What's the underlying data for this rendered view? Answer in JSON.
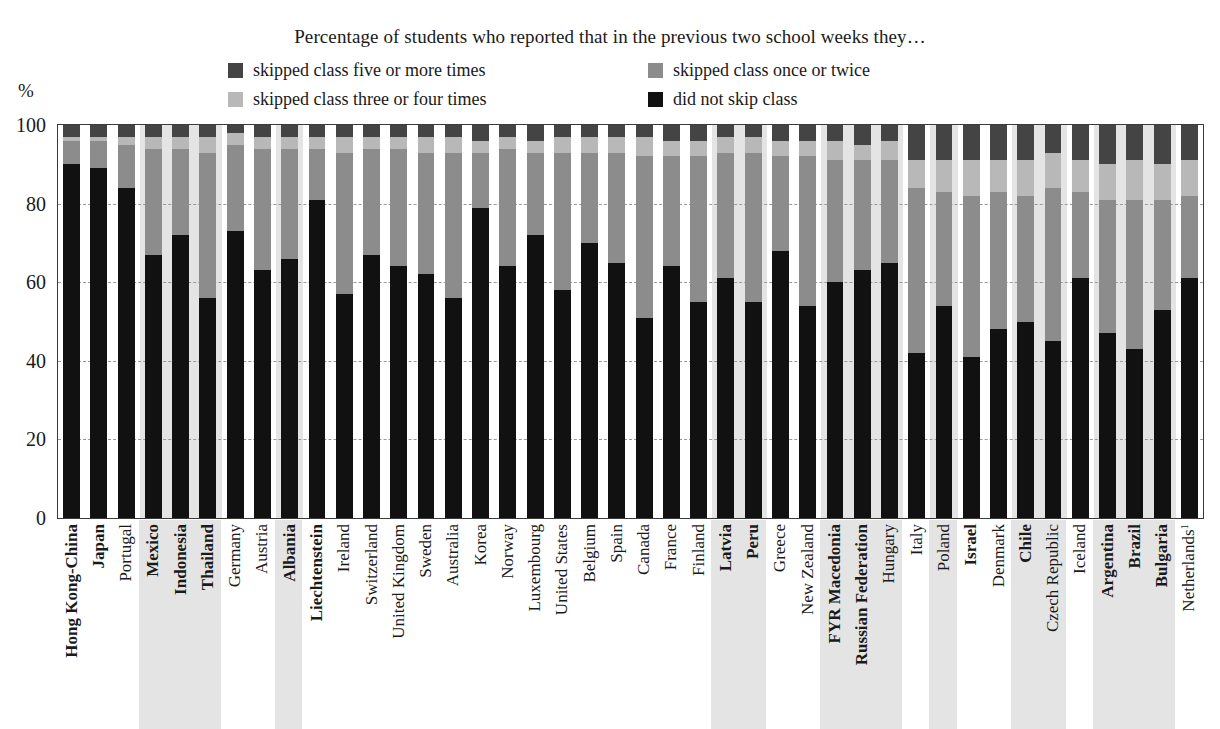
{
  "header": {
    "title": "Percentage of students who reported that in the previous two school weeks they…",
    "axis_unit": "%"
  },
  "legend": [
    {
      "label": "skipped class five or more times",
      "color": "#444444",
      "key": "five_or_more"
    },
    {
      "label": "skipped class once or twice",
      "color": "#8c8c8c",
      "key": "once_or_twice"
    },
    {
      "label": "skipped class three or four times",
      "color": "#b8b8b8",
      "key": "three_or_four"
    },
    {
      "label": "did not skip class",
      "color": "#111111",
      "key": "did_not_skip"
    }
  ],
  "chart_data": {
    "type": "bar",
    "stacked": true,
    "title": "Percentage of students who reported that in the previous two school weeks they…",
    "xlabel": "",
    "ylabel": "%",
    "ylim": [
      0,
      100
    ],
    "yticks": [
      0,
      20,
      40,
      60,
      80,
      100
    ],
    "grid": true,
    "legend_position": "top",
    "series_order_bottom_to_top": [
      "did_not_skip",
      "once_or_twice",
      "three_or_four",
      "five_or_more"
    ],
    "series": [
      {
        "name": "did not skip class",
        "key": "did_not_skip",
        "color": "#111111",
        "values": [
          90,
          89,
          84,
          67,
          72,
          56,
          73,
          63,
          66,
          81,
          57,
          67,
          64,
          62,
          56,
          79,
          64,
          72,
          58,
          70,
          65,
          51,
          64,
          55,
          61,
          55,
          68,
          54,
          60,
          63,
          65,
          42,
          54,
          41,
          48,
          50,
          45,
          61,
          47,
          43,
          53,
          61
        ]
      },
      {
        "name": "skipped class once or twice",
        "key": "once_or_twice",
        "color": "#8c8c8c",
        "values": [
          6,
          7,
          11,
          27,
          22,
          37,
          22,
          31,
          28,
          13,
          36,
          27,
          30,
          31,
          37,
          14,
          30,
          21,
          35,
          23,
          28,
          41,
          28,
          37,
          32,
          38,
          24,
          38,
          31,
          28,
          26,
          42,
          29,
          41,
          35,
          32,
          39,
          22,
          34,
          38,
          28,
          21
        ]
      },
      {
        "name": "skipped class three or four times",
        "key": "three_or_four",
        "color": "#b8b8b8",
        "values": [
          1,
          1,
          2,
          3,
          3,
          4,
          3,
          3,
          3,
          3,
          4,
          3,
          3,
          4,
          4,
          3,
          3,
          3,
          4,
          4,
          4,
          5,
          4,
          4,
          4,
          4,
          4,
          4,
          5,
          4,
          5,
          7,
          8,
          9,
          8,
          9,
          9,
          8,
          9,
          10,
          9,
          9
        ]
      },
      {
        "name": "skipped class five or more times",
        "key": "five_or_more",
        "color": "#444444",
        "values": [
          3,
          3,
          3,
          3,
          3,
          3,
          2,
          3,
          3,
          3,
          3,
          3,
          3,
          3,
          3,
          4,
          3,
          4,
          3,
          3,
          3,
          3,
          4,
          4,
          3,
          3,
          4,
          4,
          4,
          5,
          4,
          9,
          9,
          9,
          9,
          9,
          7,
          9,
          10,
          9,
          10,
          9
        ]
      }
    ],
    "categories": [
      {
        "label": "Hong Kong-China",
        "bold": true,
        "shaded": false
      },
      {
        "label": "Japan",
        "bold": true,
        "shaded": false
      },
      {
        "label": "Portugal",
        "bold": false,
        "shaded": false
      },
      {
        "label": "Mexico",
        "bold": true,
        "shaded": true
      },
      {
        "label": "Indonesia",
        "bold": true,
        "shaded": true
      },
      {
        "label": "Thailand",
        "bold": true,
        "shaded": true
      },
      {
        "label": "Germany",
        "bold": false,
        "shaded": false
      },
      {
        "label": "Austria",
        "bold": false,
        "shaded": false
      },
      {
        "label": "Albania",
        "bold": true,
        "shaded": true
      },
      {
        "label": "Liechtenstein",
        "bold": true,
        "shaded": false
      },
      {
        "label": "Ireland",
        "bold": false,
        "shaded": false
      },
      {
        "label": "Switzerland",
        "bold": false,
        "shaded": false
      },
      {
        "label": "United Kingdom",
        "bold": false,
        "shaded": false
      },
      {
        "label": "Sweden",
        "bold": false,
        "shaded": false
      },
      {
        "label": "Australia",
        "bold": false,
        "shaded": false
      },
      {
        "label": "Korea",
        "bold": false,
        "shaded": false
      },
      {
        "label": "Norway",
        "bold": false,
        "shaded": false
      },
      {
        "label": "Luxembourg",
        "bold": false,
        "shaded": false
      },
      {
        "label": "United States",
        "bold": false,
        "shaded": false
      },
      {
        "label": "Belgium",
        "bold": false,
        "shaded": false
      },
      {
        "label": "Spain",
        "bold": false,
        "shaded": false
      },
      {
        "label": "Canada",
        "bold": false,
        "shaded": false
      },
      {
        "label": "France",
        "bold": false,
        "shaded": false
      },
      {
        "label": "Finland",
        "bold": false,
        "shaded": false
      },
      {
        "label": "Latvia",
        "bold": true,
        "shaded": true
      },
      {
        "label": "Peru",
        "bold": true,
        "shaded": true
      },
      {
        "label": "Greece",
        "bold": false,
        "shaded": false
      },
      {
        "label": "New Zealand",
        "bold": false,
        "shaded": false
      },
      {
        "label": "FYR Macedonia",
        "bold": true,
        "shaded": true
      },
      {
        "label": "Russian Federation",
        "bold": true,
        "shaded": true
      },
      {
        "label": "Hungary",
        "bold": false,
        "shaded": true
      },
      {
        "label": "Italy",
        "bold": false,
        "shaded": false
      },
      {
        "label": "Poland",
        "bold": false,
        "shaded": true
      },
      {
        "label": "Israel",
        "bold": true,
        "shaded": false
      },
      {
        "label": "Denmark",
        "bold": false,
        "shaded": false
      },
      {
        "label": "Chile",
        "bold": true,
        "shaded": true
      },
      {
        "label": "Czech Republic",
        "bold": false,
        "shaded": true
      },
      {
        "label": "Iceland",
        "bold": false,
        "shaded": false
      },
      {
        "label": "Argentina",
        "bold": true,
        "shaded": true
      },
      {
        "label": "Brazil",
        "bold": true,
        "shaded": true
      },
      {
        "label": "Bulgaria",
        "bold": true,
        "shaded": true
      },
      {
        "label": "Netherlands",
        "sup": "1",
        "bold": false,
        "shaded": false
      }
    ]
  }
}
